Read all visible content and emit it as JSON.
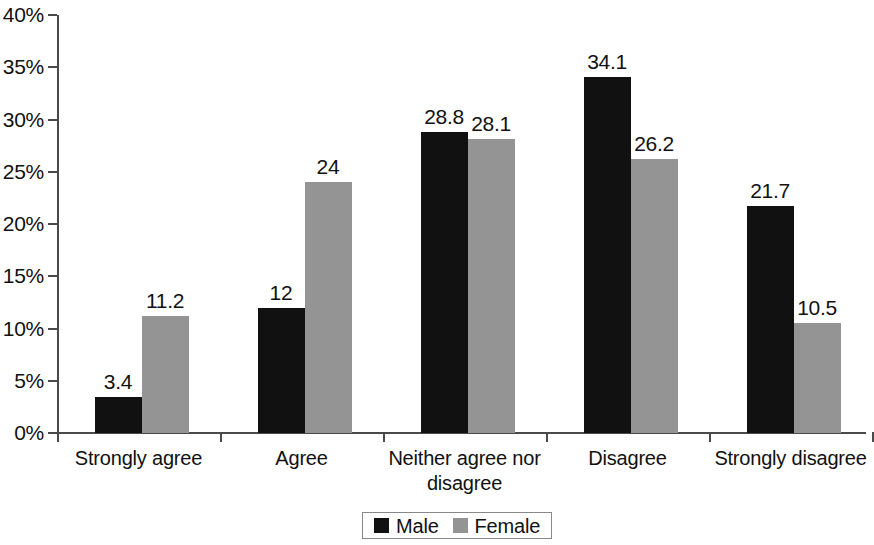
{
  "chart_data": {
    "type": "bar",
    "title": "",
    "subtitle": "",
    "xlabel": "",
    "ylabel": "",
    "grid": false,
    "legend_position": "bottom",
    "categories": [
      "Strongly agree",
      "Agree",
      "Neither agree nor disagree",
      "Disagree",
      "Strongly disagree"
    ],
    "series": [
      {
        "name": "Male",
        "color": "#111111",
        "values": [
          3.4,
          12,
          28.8,
          34.1,
          21.7
        ],
        "labels": [
          "3.4",
          "12",
          "28.8",
          "34.1",
          "21.7"
        ]
      },
      {
        "name": "Female",
        "color": "#949494",
        "values": [
          11.2,
          24,
          28.1,
          26.2,
          10.5
        ],
        "labels": [
          "11.2",
          "24",
          "28.1",
          "26.2",
          "10.5"
        ]
      }
    ],
    "ylim": [
      0,
      40
    ],
    "ytick_values": [
      0,
      5,
      10,
      15,
      20,
      25,
      30,
      35,
      40
    ],
    "ytick_labels": [
      "0%",
      "5%",
      "10%",
      "15%",
      "20%",
      "25%",
      "30%",
      "35%",
      "40%"
    ]
  },
  "legend": {
    "items": [
      {
        "label": "Male",
        "color": "#111111"
      },
      {
        "label": "Female",
        "color": "#949494"
      }
    ]
  },
  "axis_color": "#4a4a4a"
}
